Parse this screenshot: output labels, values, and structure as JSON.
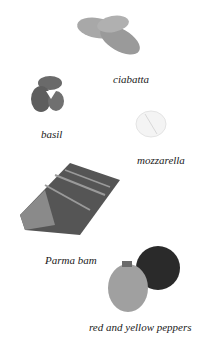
{
  "items": [
    {
      "name": "ciabatta",
      "label": "ciabatta"
    },
    {
      "name": "basil",
      "label": "basil"
    },
    {
      "name": "mozzarella",
      "label": "mozzarella"
    },
    {
      "name": "parma-ham",
      "label": "Parma bam"
    },
    {
      "name": "peppers",
      "label": "red and yellow peppers"
    }
  ]
}
